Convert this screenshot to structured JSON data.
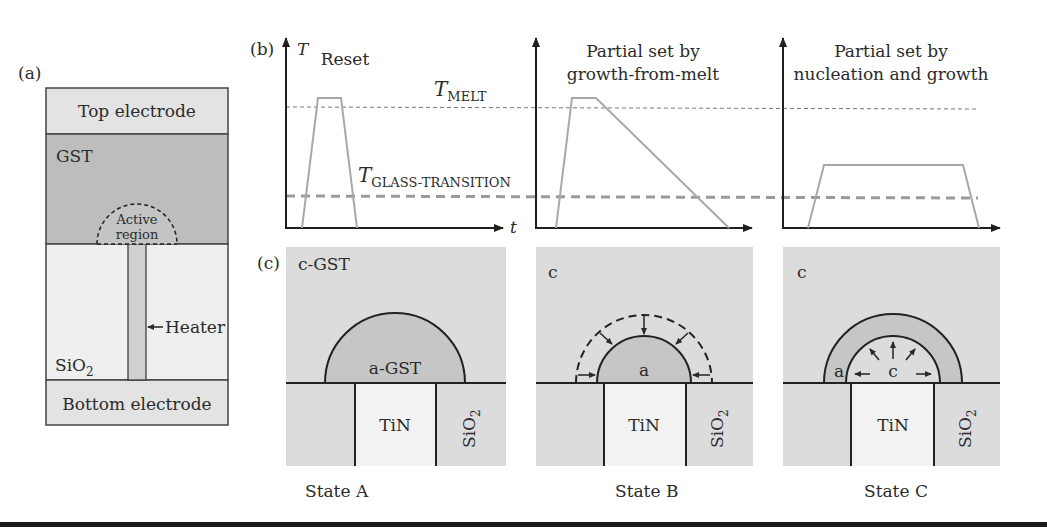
{
  "figure": {
    "panel_a": {
      "label": "(a)",
      "layers": {
        "top_electrode": "Top electrode",
        "gst": "GST",
        "active_region_line1": "Active",
        "active_region_line2": "region",
        "heater": "Heater",
        "sio2": "SiO",
        "sio2_sub": "2",
        "bottom_electrode": "Bottom electrode"
      }
    },
    "panel_b": {
      "label": "(b)",
      "y_axis": "T",
      "x_axis": "t",
      "t_melt": "T",
      "t_melt_sub": "MELT",
      "t_glass": "T",
      "t_glass_sub": "GLASS-TRANSITION",
      "plots": [
        {
          "title_line1": "Reset",
          "title_line2": ""
        },
        {
          "title_line1": "Partial set by",
          "title_line2": "growth-from-melt"
        },
        {
          "title_line1": "Partial set by",
          "title_line2": "nucleation and growth"
        }
      ]
    },
    "panel_c": {
      "label": "(c)",
      "states": [
        {
          "matrix": "c-GST",
          "region": "a-GST",
          "electrode": "TiN",
          "oxide": "SiO",
          "oxide_sub": "2",
          "caption": "State A"
        },
        {
          "matrix": "c",
          "region": "a",
          "electrode": "TiN",
          "oxide": "SiO",
          "oxide_sub": "2",
          "caption": "State B"
        },
        {
          "matrix": "c",
          "region_outer": "a",
          "region_inner": "c",
          "electrode": "TiN",
          "oxide": "SiO",
          "oxide_sub": "2",
          "caption": "State C"
        }
      ]
    },
    "colors": {
      "electrode": "#e3e3e3",
      "gst_dark": "#bdbdbd",
      "sio2_light": "#efefef",
      "heater": "#d0d0d0",
      "cgst": "#dcdcdc",
      "agst": "#c6c6c6",
      "tin": "#f2f2f2",
      "pulse": "#a8a8a8",
      "axis": "#1f1f1f"
    }
  }
}
